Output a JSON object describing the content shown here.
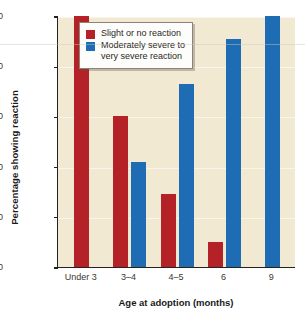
{
  "chart_data": {
    "type": "bar",
    "title": "",
    "xlabel": "Age at adoption (months)",
    "ylabel": "Percentage showing reaction",
    "categories": [
      "Under 3",
      "3–4",
      "4–5",
      "6",
      "9"
    ],
    "series": [
      {
        "name": "Slight or no reaction",
        "color": "#b42227",
        "values": [
          100,
          60,
          29,
          10,
          null
        ]
      },
      {
        "name": "Moderately severe to very severe reaction",
        "color": "#1e6cb4",
        "values": [
          null,
          42,
          73,
          91,
          100
        ]
      }
    ],
    "ylim": [
      0,
      100
    ],
    "yticks": [
      0,
      20,
      40,
      60,
      80,
      100
    ],
    "ytick_labels": [
      "0",
      "20",
      "40",
      "60",
      "80",
      "100"
    ],
    "grid": false,
    "legend_position": "top-center",
    "plot_background": "#f1e9d2"
  },
  "legend": {
    "items": [
      {
        "label": "Slight or no reaction",
        "label_line2": ""
      },
      {
        "label": "Moderately severe to",
        "label_line2": "very severe reaction"
      }
    ]
  }
}
